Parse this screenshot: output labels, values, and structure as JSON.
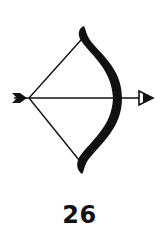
{
  "card": {
    "icon": "bow-and-arrow-icon",
    "number": "26",
    "ink_color": "#111111",
    "background_color": "#ffffff"
  }
}
